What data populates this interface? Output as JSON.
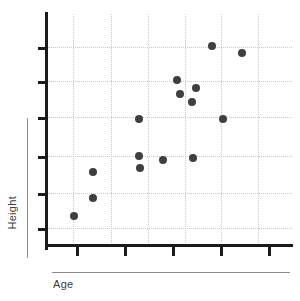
{
  "chart_data": {
    "type": "scatter",
    "title": "",
    "subtitle": "",
    "xlabel": "Age",
    "ylabel": "Height",
    "grid": true,
    "legend": false,
    "legend_position": "none",
    "xlim": [
      0,
      10
    ],
    "ylim": [
      0,
      10
    ],
    "x_tick_labels": [],
    "y_tick_labels": [],
    "x_tick_count": 5,
    "y_tick_count": 6,
    "x_gridline_count": 6,
    "y_gridline_count": 6,
    "point_count": 17,
    "series": [
      {
        "name": "",
        "color": "#3f3f3f",
        "marker": "circle",
        "marker_size": 8,
        "points": [
          {
            "px": 74,
            "py": 216
          },
          {
            "px": 93,
            "py": 198
          },
          {
            "px": 93,
            "py": 172
          },
          {
            "px": 139,
            "py": 156
          },
          {
            "px": 140,
            "py": 168
          },
          {
            "px": 139,
            "py": 119
          },
          {
            "px": 163,
            "py": 160
          },
          {
            "px": 177,
            "py": 80
          },
          {
            "px": 180,
            "py": 94
          },
          {
            "px": 192,
            "py": 102
          },
          {
            "px": 196,
            "py": 88
          },
          {
            "px": 193,
            "py": 158
          },
          {
            "px": 212,
            "py": 46
          },
          {
            "px": 223,
            "py": 119
          },
          {
            "px": 242,
            "py": 53
          }
        ]
      }
    ]
  },
  "axes": {
    "y_ticks_px": [
      47,
      81,
      117,
      156,
      193,
      228
    ],
    "x_ticks_px": [
      76,
      124,
      172,
      220,
      268
    ],
    "v_gridlines_px": [
      73,
      111,
      148,
      185,
      221,
      258
    ],
    "h_gridlines_px": [
      47,
      81,
      117,
      156,
      193,
      228
    ],
    "axis_color": "#1b1b1b",
    "grid_color": "#c9c9c9",
    "label_color": "#3c3c3c"
  },
  "labels": {
    "y_axis_title": "Height",
    "x_axis_title": "Age"
  }
}
